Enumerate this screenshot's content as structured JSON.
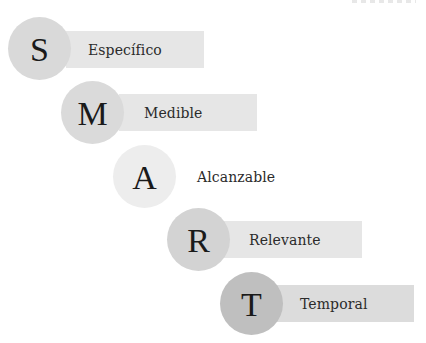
{
  "diagram": {
    "title_hint": "SMART",
    "items": [
      {
        "letter": "S",
        "label": "Específico",
        "circle_color": "#d9d9d9",
        "bar_color": "#e6e6e6",
        "has_bar": true
      },
      {
        "letter": "M",
        "label": "Medible",
        "circle_color": "#dadada",
        "bar_color": "#e6e6e6",
        "has_bar": true
      },
      {
        "letter": "A",
        "label": "Alcanzable",
        "circle_color": "#ededed",
        "bar_color": "#ffffff",
        "has_bar": false
      },
      {
        "letter": "R",
        "label": "Relevante",
        "circle_color": "#d3d3d3",
        "bar_color": "#e6e6e6",
        "has_bar": true
      },
      {
        "letter": "T",
        "label": "Temporal",
        "circle_color": "#bfbfbf",
        "bar_color": "#dcdcdc",
        "has_bar": true
      }
    ]
  }
}
